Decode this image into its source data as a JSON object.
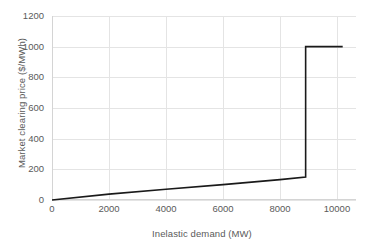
{
  "chart_data": {
    "type": "line",
    "title": "",
    "xlabel": "Inelastic demand (MW)",
    "ylabel": "Market clearing price ($/MWh)",
    "xlim": [
      0,
      10667
    ],
    "ylim": [
      0,
      1200
    ],
    "xticks": [
      0,
      2000,
      4000,
      6000,
      8000,
      10000
    ],
    "xtick_labels": [
      "0",
      "2000",
      "4000",
      "6000",
      "8000",
      "10000"
    ],
    "yticks": [
      0,
      200,
      400,
      600,
      800,
      1000,
      1200
    ],
    "ytick_labels": [
      "0",
      "200",
      "400",
      "600",
      "800",
      "1000",
      "1200"
    ],
    "grid": true,
    "legend": "none",
    "series": [
      {
        "name": "Supply stack / market clearing price",
        "color": "#1a1a1a",
        "line_width": 1.6,
        "x": [
          0,
          2000,
          4000,
          6000,
          8000,
          8900,
          8900,
          10200
        ],
        "y": [
          0,
          38,
          70,
          100,
          133,
          150,
          1000,
          1000
        ],
        "points": [
          {
            "x": 0,
            "y": 0
          },
          {
            "x": 2000,
            "y": 38
          },
          {
            "x": 4000,
            "y": 70
          },
          {
            "x": 6000,
            "y": 100
          },
          {
            "x": 8000,
            "y": 133
          },
          {
            "x": 8900,
            "y": 150
          },
          {
            "x": 8900,
            "y": 1000
          },
          {
            "x": 10200,
            "y": 1000
          }
        ]
      }
    ],
    "annotations": {
      "price_cap": 1000,
      "kink_demand": 8900,
      "kink_price": 150
    }
  },
  "colors": {
    "background": "#ffffff",
    "gridline": "#e4e4e4",
    "axis": "#d4d4d4",
    "text": "#5a5a5a",
    "series": "#1a1a1a"
  }
}
